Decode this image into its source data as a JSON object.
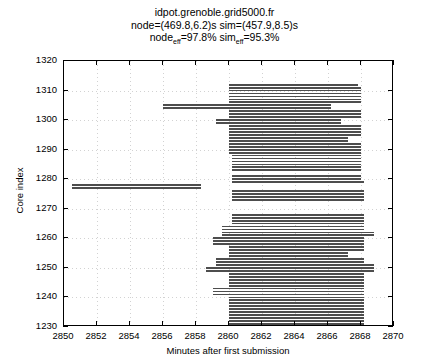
{
  "chart_data": {
    "type": "bar",
    "orientation": "horizontal",
    "title_lines": [
      "idpot.grenoble.grid5000.fr",
      "node=(469.8,6.2)s sim=(457.9,8.5)s",
      "node_eff=97.8% sim_eff=95.3%"
    ],
    "title_line1": "idpot.grenoble.grid5000.fr",
    "title_line2": "node=(469.8,6.2)s sim=(457.9,8.5)s",
    "title_line3_a": "node",
    "title_line3_sub_a": "eff",
    "title_line3_b": "=97.8% sim",
    "title_line3_sub_b": "eff",
    "title_line3_c": "=95.3%",
    "metrics": {
      "node_mean_s": 469.8,
      "node_sd_s": 6.2,
      "sim_mean_s": 457.9,
      "sim_sd_s": 8.5,
      "node_eff_pct": 97.8,
      "sim_eff_pct": 95.3
    },
    "xlabel": "Minutes after first submission",
    "ylabel": "Core index",
    "xlim": [
      2850,
      2870
    ],
    "ylim": [
      1230,
      1320
    ],
    "xticks": [
      2850,
      2852,
      2854,
      2856,
      2858,
      2860,
      2862,
      2864,
      2866,
      2868,
      2870
    ],
    "yticks": [
      1230,
      1240,
      1250,
      1260,
      1270,
      1280,
      1290,
      1300,
      1310,
      1320
    ],
    "grid": true,
    "legend": null,
    "colors": {
      "bar": "#4d4d4d",
      "bar_light": "#d9d9d9",
      "axis": "#000000",
      "grid": "#d2d2d2",
      "background": "#ffffff"
    },
    "bars": [
      {
        "core": 1278,
        "start": 2850.5,
        "end": 2858.3,
        "shade": "dark"
      },
      {
        "core": 1277,
        "start": 2850.5,
        "end": 2858.3,
        "shade": "dark"
      },
      {
        "core": 1312,
        "start": 2860.0,
        "end": 2867.8,
        "shade": "dark"
      },
      {
        "core": 1311,
        "start": 2860.0,
        "end": 2868.0,
        "shade": "dark"
      },
      {
        "core": 1310,
        "start": 2860.0,
        "end": 2868.0,
        "shade": "dark"
      },
      {
        "core": 1309,
        "start": 2860.0,
        "end": 2868.0,
        "shade": "dark"
      },
      {
        "core": 1308,
        "start": 2860.0,
        "end": 2868.0,
        "shade": "dark"
      },
      {
        "core": 1307,
        "start": 2860.0,
        "end": 2868.0,
        "shade": "dark"
      },
      {
        "core": 1306,
        "start": 2860.0,
        "end": 2868.0,
        "shade": "dark"
      },
      {
        "core": 1305,
        "start": 2856.0,
        "end": 2866.2,
        "shade": "dark"
      },
      {
        "core": 1304,
        "start": 2856.0,
        "end": 2866.2,
        "shade": "dark"
      },
      {
        "core": 1303,
        "start": 2860.0,
        "end": 2868.0,
        "shade": "dark"
      },
      {
        "core": 1302,
        "start": 2860.0,
        "end": 2868.0,
        "shade": "dark"
      },
      {
        "core": 1301,
        "start": 2860.0,
        "end": 2868.0,
        "shade": "dark"
      },
      {
        "core": 1300,
        "start": 2859.2,
        "end": 2866.8,
        "shade": "dark"
      },
      {
        "core": 1299,
        "start": 2859.2,
        "end": 2866.8,
        "shade": "dark"
      },
      {
        "core": 1298,
        "start": 2860.0,
        "end": 2868.0,
        "shade": "dark"
      },
      {
        "core": 1297,
        "start": 2860.0,
        "end": 2868.0,
        "shade": "dark"
      },
      {
        "core": 1296,
        "start": 2860.0,
        "end": 2868.0,
        "shade": "dark"
      },
      {
        "core": 1295,
        "start": 2860.0,
        "end": 2868.0,
        "shade": "dark"
      },
      {
        "core": 1294,
        "start": 2860.0,
        "end": 2867.2,
        "shade": "dark"
      },
      {
        "core": 1293,
        "start": 2860.0,
        "end": 2867.2,
        "shade": "dark"
      },
      {
        "core": 1292,
        "start": 2860.0,
        "end": 2868.0,
        "shade": "dark"
      },
      {
        "core": 1291,
        "start": 2860.0,
        "end": 2868.0,
        "shade": "dark"
      },
      {
        "core": 1290,
        "start": 2860.0,
        "end": 2868.0,
        "shade": "dark"
      },
      {
        "core": 1289,
        "start": 2860.0,
        "end": 2868.0,
        "shade": "dark"
      },
      {
        "core": 1288,
        "start": 2860.2,
        "end": 2868.0,
        "shade": "dark"
      },
      {
        "core": 1287,
        "start": 2860.2,
        "end": 2868.0,
        "shade": "dark"
      },
      {
        "core": 1286,
        "start": 2860.2,
        "end": 2868.0,
        "shade": "dark"
      },
      {
        "core": 1285,
        "start": 2860.2,
        "end": 2868.0,
        "shade": "dark"
      },
      {
        "core": 1284,
        "start": 2860.2,
        "end": 2868.0,
        "shade": "dark"
      },
      {
        "core": 1283,
        "start": 2860.2,
        "end": 2868.0,
        "shade": "dark"
      },
      {
        "core": 1281,
        "start": 2860.2,
        "end": 2868.0,
        "shade": "dark"
      },
      {
        "core": 1280,
        "start": 2860.2,
        "end": 2868.0,
        "shade": "dark"
      },
      {
        "core": 1279,
        "start": 2860.2,
        "end": 2868.2,
        "shade": "dark"
      },
      {
        "core": 1276,
        "start": 2860.2,
        "end": 2868.2,
        "shade": "dark"
      },
      {
        "core": 1275,
        "start": 2860.2,
        "end": 2868.2,
        "shade": "dark"
      },
      {
        "core": 1274,
        "start": 2860.2,
        "end": 2868.2,
        "shade": "dark"
      },
      {
        "core": 1273,
        "start": 2860.2,
        "end": 2868.2,
        "shade": "dark"
      },
      {
        "core": 1268,
        "start": 2860.2,
        "end": 2868.2,
        "shade": "dark"
      },
      {
        "core": 1267,
        "start": 2860.2,
        "end": 2868.2,
        "shade": "dark"
      },
      {
        "core": 1266,
        "start": 2860.2,
        "end": 2868.2,
        "shade": "dark"
      },
      {
        "core": 1265,
        "start": 2860.2,
        "end": 2868.2,
        "shade": "dark"
      },
      {
        "core": 1264,
        "start": 2859.6,
        "end": 2868.2,
        "shade": "dark"
      },
      {
        "core": 1263,
        "start": 2859.6,
        "end": 2868.2,
        "shade": "dark"
      },
      {
        "core": 1262,
        "start": 2859.6,
        "end": 2868.8,
        "shade": "dark"
      },
      {
        "core": 1261,
        "start": 2859.6,
        "end": 2868.8,
        "shade": "dark"
      },
      {
        "core": 1260,
        "start": 2859.0,
        "end": 2868.2,
        "shade": "dark"
      },
      {
        "core": 1259,
        "start": 2859.0,
        "end": 2868.2,
        "shade": "dark"
      },
      {
        "core": 1258,
        "start": 2859.0,
        "end": 2868.2,
        "shade": "dark"
      },
      {
        "core": 1257,
        "start": 2860.0,
        "end": 2868.2,
        "shade": "dark"
      },
      {
        "core": 1256,
        "start": 2860.0,
        "end": 2868.2,
        "shade": "dark"
      },
      {
        "core": 1255,
        "start": 2860.0,
        "end": 2867.2,
        "shade": "dark"
      },
      {
        "core": 1254,
        "start": 2860.0,
        "end": 2867.2,
        "shade": "dark"
      },
      {
        "core": 1253,
        "start": 2859.2,
        "end": 2868.2,
        "shade": "dark"
      },
      {
        "core": 1252,
        "start": 2859.2,
        "end": 2868.2,
        "shade": "dark"
      },
      {
        "core": 1251,
        "start": 2859.2,
        "end": 2868.8,
        "shade": "dark"
      },
      {
        "core": 1250,
        "start": 2858.6,
        "end": 2868.8,
        "shade": "dark"
      },
      {
        "core": 1249,
        "start": 2858.6,
        "end": 2868.8,
        "shade": "dark"
      },
      {
        "core": 1248,
        "start": 2860.0,
        "end": 2868.2,
        "shade": "dark"
      },
      {
        "core": 1247,
        "start": 2860.0,
        "end": 2868.2,
        "shade": "dark"
      },
      {
        "core": 1246,
        "start": 2860.0,
        "end": 2868.2,
        "shade": "dark"
      },
      {
        "core": 1245,
        "start": 2860.0,
        "end": 2868.2,
        "shade": "dark"
      },
      {
        "core": 1244,
        "start": 2860.0,
        "end": 2868.2,
        "shade": "dark"
      },
      {
        "core": 1243,
        "start": 2859.0,
        "end": 2868.2,
        "shade": "dark"
      },
      {
        "core": 1242,
        "start": 2859.0,
        "end": 2868.2,
        "shade": "dark"
      },
      {
        "core": 1241,
        "start": 2859.0,
        "end": 2868.2,
        "shade": "dark"
      },
      {
        "core": 1240,
        "start": 2860.0,
        "end": 2868.2,
        "shade": "dark"
      },
      {
        "core": 1239,
        "start": 2860.0,
        "end": 2868.2,
        "shade": "dark"
      },
      {
        "core": 1238,
        "start": 2860.0,
        "end": 2868.2,
        "shade": "dark"
      },
      {
        "core": 1237,
        "start": 2860.0,
        "end": 2868.2,
        "shade": "dark"
      },
      {
        "core": 1236,
        "start": 2860.0,
        "end": 2868.2,
        "shade": "dark"
      },
      {
        "core": 1235,
        "start": 2860.0,
        "end": 2868.2,
        "shade": "dark"
      },
      {
        "core": 1234,
        "start": 2860.0,
        "end": 2868.2,
        "shade": "dark"
      },
      {
        "core": 1233,
        "start": 2860.0,
        "end": 2868.2,
        "shade": "dark"
      },
      {
        "core": 1232,
        "start": 2860.0,
        "end": 2868.2,
        "shade": "dark"
      },
      {
        "core": 1231,
        "start": 2860.0,
        "end": 2868.2,
        "shade": "dark"
      },
      {
        "core": 1230,
        "start": 2860.0,
        "end": 2868.2,
        "shade": "dark"
      }
    ]
  }
}
